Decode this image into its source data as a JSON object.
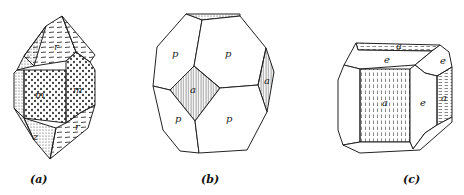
{
  "figures": [
    {
      "id": "a",
      "caption": "(a)",
      "faces": {
        "r_top": "r",
        "m_left": "m",
        "m_right": "m",
        "r_bottom": "r",
        "z_bottom": "z"
      }
    },
    {
      "id": "b",
      "caption": "(b)",
      "faces": {
        "p_upper_left": "p",
        "p_upper_right": "p",
        "a_center": "a",
        "a_right": "a",
        "p_lower_left": "p",
        "p_lower_right": "p"
      }
    },
    {
      "id": "c",
      "caption": "(c)",
      "faces": {
        "a_top": "a",
        "e_top": "e",
        "e_top_right": "e",
        "a_front": "a",
        "e_right": "e",
        "a_right": "a"
      }
    }
  ]
}
